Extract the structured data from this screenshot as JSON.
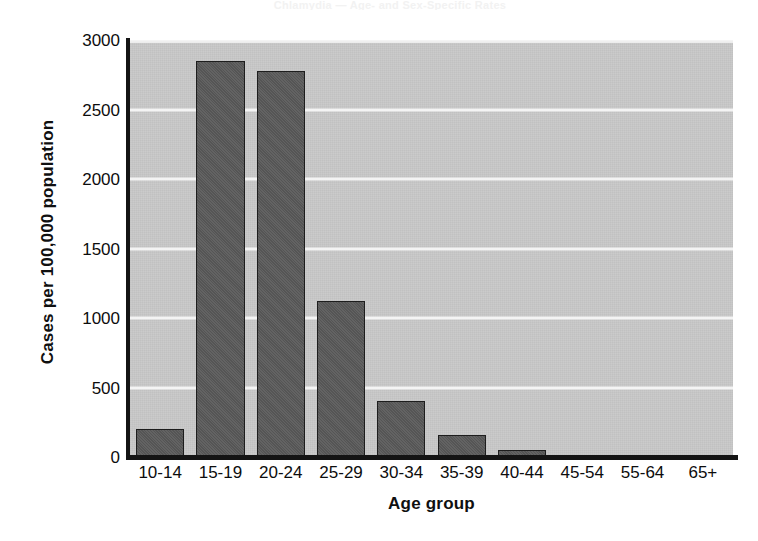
{
  "figure": {
    "background_color": "#ffffff",
    "plot_background_color": "#c9c9c9",
    "gridline_color": "#f4f4f4",
    "axis_color": "#141414",
    "bar_fill_color": "#5a5a5a",
    "bar_border_color": "#1d1d1d",
    "scan_artifact_text": "Chlamydia — Age- and Sex-Specific Rates"
  },
  "chart_data": {
    "type": "bar",
    "title": "",
    "xlabel": "Age group",
    "ylabel": "Cases per 100,000 population",
    "categories": [
      "10-14",
      "15-19",
      "20-24",
      "25-29",
      "30-34",
      "35-39",
      "40-44",
      "45-54",
      "55-64",
      "65+"
    ],
    "values": [
      200,
      2850,
      2780,
      1120,
      400,
      160,
      50,
      15,
      0,
      0
    ],
    "ylim": [
      0,
      3000
    ],
    "yticks": [
      0,
      500,
      1000,
      1500,
      2000,
      2500,
      3000
    ],
    "ytick_labels": [
      "0",
      "500",
      "1000",
      "1500",
      "2000",
      "2500",
      "3000"
    ],
    "grid": true,
    "grid_axis": "y",
    "legend": false,
    "legend_position": "none",
    "series": [
      {
        "name": "Cases per 100,000 population",
        "values": [
          200,
          2850,
          2780,
          1120,
          400,
          160,
          50,
          15,
          0,
          0
        ]
      }
    ]
  }
}
